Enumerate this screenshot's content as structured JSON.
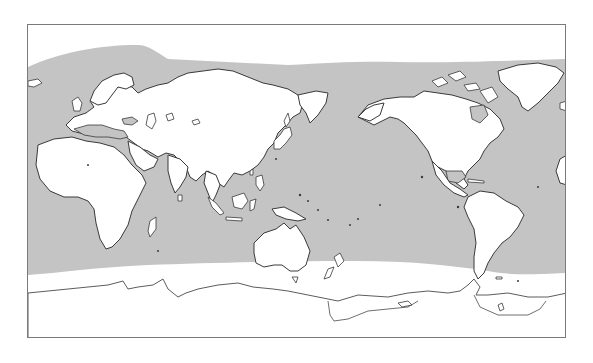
{
  "map": {
    "type": "world-map",
    "projection": "equirectangular, Pacific-centered",
    "center_longitude": "150E",
    "colors": {
      "ocean_shaded": "#c4c4c4",
      "ocean_unshaded": "#ffffff",
      "land": "#ffffff",
      "coastline": "#3a3a3a",
      "frame": "#7a7a7a"
    },
    "shaded_region": "ocean band between approx. 70N (Atlantic ~75N) and 60S",
    "features": [
      {
        "name": "Europe"
      },
      {
        "name": "Asia"
      },
      {
        "name": "Africa"
      },
      {
        "name": "Australia"
      },
      {
        "name": "North America"
      },
      {
        "name": "South America"
      },
      {
        "name": "Greenland"
      },
      {
        "name": "Antarctica"
      },
      {
        "name": "New Zealand"
      },
      {
        "name": "Japan"
      },
      {
        "name": "Madagascar"
      }
    ]
  }
}
